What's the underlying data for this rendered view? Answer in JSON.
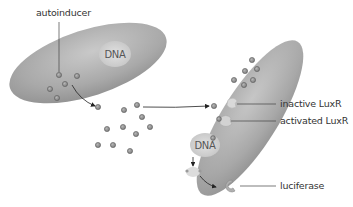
{
  "diagram": {
    "labels": {
      "autoinducer": "autoinducer",
      "inactive_luxr": "inactive LuxR",
      "activated_luxr": "activated LuxR",
      "luciferase": "luciferase",
      "dna_left": "DNA",
      "dna_right": "DNA"
    },
    "colors": {
      "cell_fill_light": "#c8c8c8",
      "cell_fill_dark": "#8f8f8f",
      "dna_fill": "#d6d6d6",
      "molecule_fill": "#9a9a9a",
      "molecule_stroke": "#5e5e5e",
      "arrow": "#222222",
      "leader_line": "#444444"
    },
    "cells": [
      {
        "id": "left-cell",
        "contains": [
          "DNA",
          "autoinducer molecules"
        ]
      },
      {
        "id": "right-cell",
        "contains": [
          "autoinducer molecules",
          "inactive LuxR",
          "activated LuxR",
          "DNA"
        ]
      }
    ]
  }
}
